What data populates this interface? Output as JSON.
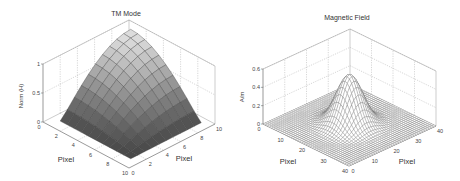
{
  "chart_data": [
    {
      "type": "surface",
      "title": "TM Mode",
      "xlabel": "Pixel",
      "ylabel": "Pixel",
      "zlabel": "Norm (H)",
      "x_ticks": [
        "0",
        "2",
        "4",
        "6",
        "8",
        "10"
      ],
      "y_ticks": [
        "0",
        "2",
        "4",
        "6",
        "8",
        "10"
      ],
      "z_ticks": [
        "0",
        "0.5",
        "1"
      ],
      "xlim": [
        0,
        10
      ],
      "ylim": [
        0,
        10
      ],
      "zlim": [
        0,
        1
      ],
      "grid": true,
      "colormap": "gray",
      "description": "Surface rising from ~0 along one edge to 1 at the far corner; z ≈ sin(pi*x/20)*sin(pi*y/20)-like shape",
      "grid_size": 10,
      "surface_formula": "sin(pi*(x-1)/18)*sin(pi*(y-1)/18)"
    },
    {
      "type": "mesh",
      "title": "Magnetic Field",
      "xlabel": "Pixel",
      "ylabel": "Pixel",
      "zlabel": "A/m",
      "x_ticks": [
        "0",
        "10",
        "20",
        "30",
        "40"
      ],
      "y_ticks": [
        "0",
        "10",
        "20",
        "30",
        "40"
      ],
      "z_ticks": [
        "0",
        "0.2",
        "0.4",
        "0.6"
      ],
      "xlim": [
        0,
        40
      ],
      "ylim": [
        0,
        40
      ],
      "zlim": [
        0,
        0.6
      ],
      "grid": true,
      "peak_value": 0.55,
      "peak_location": [
        20,
        20
      ],
      "description": "Gaussian peak centered at pixel (20,20), max ≈ 0.55 A/m",
      "grid_size": 40,
      "sigma": 4.5
    }
  ]
}
